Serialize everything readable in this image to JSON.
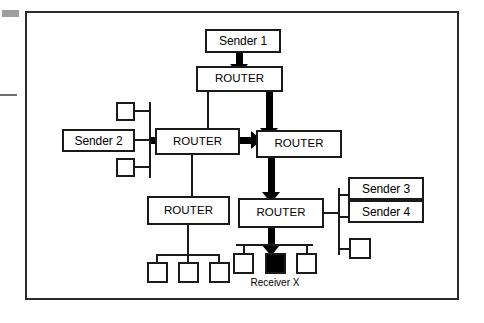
{
  "figure": {
    "type": "network-topology-diagram",
    "frame": {
      "border_color": "#2b2b2b"
    },
    "colors": {
      "stroke": "#1a1a1a",
      "frame": "#2b2b2b",
      "flow_arrow": "#000000",
      "receiver_fill": "#000000",
      "background": "#ffffff"
    }
  },
  "nodes": {
    "sender1": {
      "label": "Sender 1",
      "kind": "sender"
    },
    "sender2": {
      "label": "Sender 2",
      "kind": "sender"
    },
    "sender3": {
      "label": "Sender 3",
      "kind": "sender"
    },
    "sender4": {
      "label": "Sender 4",
      "kind": "sender"
    },
    "router_top": {
      "label": "ROUTER",
      "kind": "router"
    },
    "router_left": {
      "label": "ROUTER",
      "kind": "router"
    },
    "router_center": {
      "label": "ROUTER",
      "kind": "router"
    },
    "router_bottom_left": {
      "label": "ROUTER",
      "kind": "router"
    },
    "router_bottom_right": {
      "label": "ROUTER",
      "kind": "router"
    }
  },
  "labels": {
    "receiver": "Receiver X"
  },
  "hosts": [
    {
      "id": "host-upper-left",
      "filled": false
    },
    {
      "id": "host-lower-left",
      "filled": false
    },
    {
      "id": "host-lan-left-1",
      "filled": false
    },
    {
      "id": "host-lan-left-2",
      "filled": false
    },
    {
      "id": "host-lan-left-3",
      "filled": false
    },
    {
      "id": "host-lan-right-1",
      "filled": false
    },
    {
      "id": "host-receiver-x",
      "filled": true
    },
    {
      "id": "host-lan-right-3",
      "filled": false
    },
    {
      "id": "host-right-side",
      "filled": false
    }
  ],
  "flows": [
    {
      "from": "sender1",
      "to": "router_top",
      "style": "thick"
    },
    {
      "from": "router_top",
      "to": "router_center",
      "style": "thick"
    },
    {
      "from": "sender2",
      "to": "router_left",
      "style": "thick"
    },
    {
      "from": "router_left",
      "to": "router_center",
      "style": "thick"
    },
    {
      "from": "router_center",
      "to": "router_bottom_right",
      "style": "thick"
    },
    {
      "from": "router_bottom_right",
      "to": "host-receiver-x",
      "style": "thick"
    },
    {
      "from": "router_top",
      "to": "router_left",
      "style": "thin"
    },
    {
      "from": "router_left",
      "to": "router_bottom_left",
      "style": "thin"
    },
    {
      "from": "router_bottom_left",
      "to": "left-lan-bus",
      "style": "thin"
    },
    {
      "from": "router_bottom_right",
      "to": "right-side-bus",
      "style": "thin"
    }
  ]
}
